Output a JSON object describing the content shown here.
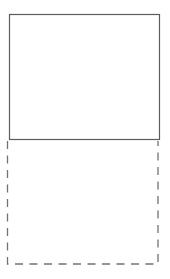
{
  "figure": {
    "background_color": "#ffffff",
    "shapes": [
      {
        "id": "solid-rectangle",
        "border_style": "solid",
        "border_color": "#585d60"
      },
      {
        "id": "dashed-rectangle",
        "border_style": "dashed",
        "border_color": "#6e7377"
      }
    ]
  }
}
